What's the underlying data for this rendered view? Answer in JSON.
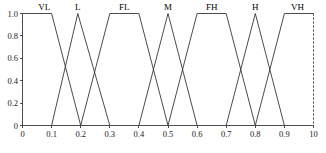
{
  "chart_data": {
    "type": "line",
    "title": "",
    "subtitle": "",
    "xlabel": "",
    "ylabel": "",
    "xlim": [
      0,
      1.0
    ],
    "ylim": [
      0,
      1.0
    ],
    "grid": false,
    "legend_position": "inline-top",
    "x_tick_labels": [
      "0",
      "0.1",
      "0.2",
      "0.3",
      "0.4",
      "0.5",
      "0.6",
      "0.7",
      "0.8",
      "0.9",
      "10"
    ],
    "x_tick_values": [
      0,
      0.1,
      0.2,
      0.3,
      0.4,
      0.5,
      0.6,
      0.7,
      0.8,
      0.9,
      1.0
    ],
    "y_tick_labels": [
      "0",
      "0.2",
      "0.4",
      "0.6",
      "0.8",
      "1.0"
    ],
    "y_tick_values": [
      0,
      0.2,
      0.4,
      0.6,
      0.8,
      1.0
    ],
    "right_edge_dashed": true,
    "series": [
      {
        "name": "VL",
        "shape": "trapezoid",
        "label_x": 0.075,
        "points": [
          [
            0,
            1.0
          ],
          [
            0.1,
            1.0
          ],
          [
            0.2,
            0
          ]
        ]
      },
      {
        "name": "L",
        "shape": "triangle",
        "label_x": 0.19,
        "points": [
          [
            0.1,
            0
          ],
          [
            0.19,
            1.0
          ],
          [
            0.3,
            0
          ]
        ]
      },
      {
        "name": "FL",
        "shape": "trapezoid",
        "label_x": 0.35,
        "points": [
          [
            0.2,
            0
          ],
          [
            0.3,
            1.0
          ],
          [
            0.4,
            1.0
          ],
          [
            0.5,
            0
          ]
        ]
      },
      {
        "name": "M",
        "shape": "triangle",
        "label_x": 0.5,
        "points": [
          [
            0.4,
            0
          ],
          [
            0.5,
            1.0
          ],
          [
            0.6,
            0
          ]
        ]
      },
      {
        "name": "FH",
        "shape": "trapezoid",
        "label_x": 0.65,
        "points": [
          [
            0.5,
            0
          ],
          [
            0.6,
            1.0
          ],
          [
            0.7,
            1.0
          ],
          [
            0.8,
            0
          ]
        ]
      },
      {
        "name": "H",
        "shape": "triangle",
        "label_x": 0.8,
        "points": [
          [
            0.7,
            0
          ],
          [
            0.8,
            1.0
          ],
          [
            0.9,
            0
          ]
        ]
      },
      {
        "name": "VH",
        "shape": "trapezoid",
        "label_x": 0.945,
        "points": [
          [
            0.8,
            0
          ],
          [
            0.9,
            1.0
          ],
          [
            1.0,
            1.0
          ]
        ]
      }
    ]
  }
}
